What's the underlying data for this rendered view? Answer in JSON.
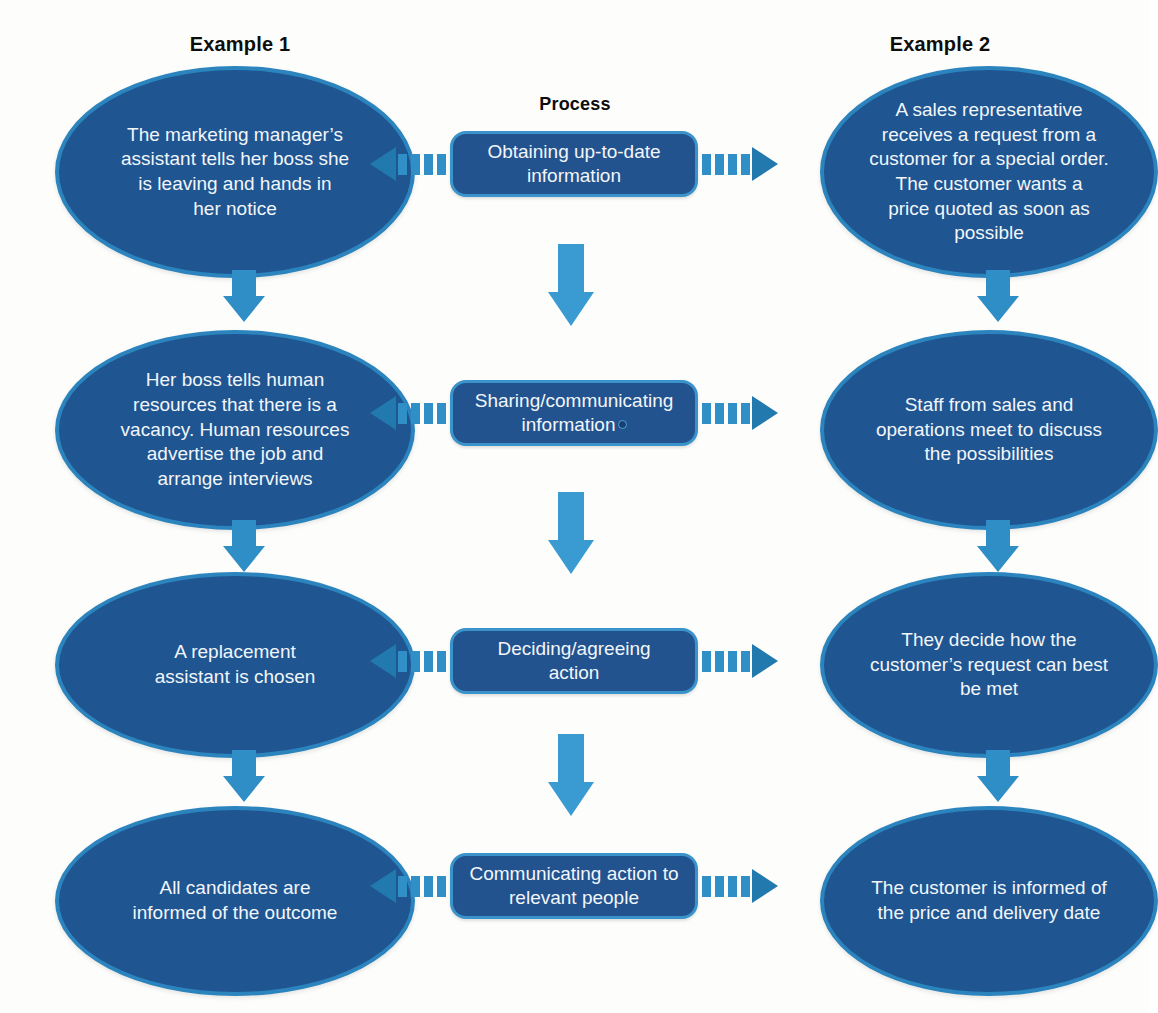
{
  "headings": {
    "left_column": "Example 1",
    "center_column": "Process",
    "right_column": "Example 2"
  },
  "colors": {
    "ellipse_fill": "#1f5591",
    "ellipse_border": "#2b84bd",
    "process_fill": "#22538e",
    "process_border": "#3a93ca",
    "arrow_light": "#3a9bd2",
    "arrow_dark": "#2279ae",
    "text": "#f2f6fa",
    "heading_text": "#0d0d0d",
    "background": "#fdfdfc"
  },
  "rows": [
    {
      "process": "Obtaining up-to-date\ninformation",
      "example1": "The marketing manager’s\nassistant tells her boss she\nis leaving and hands in\nher notice",
      "example2": "A sales representative\nreceives a request from a\ncustomer for a special order.\nThe customer wants a\nprice quoted as soon as\npossible"
    },
    {
      "process": "Sharing/communicating\ninformation",
      "example1": "Her boss tells human\nresources that there is a\nvacancy.  Human resources\nadvertise the job and\narrange interviews",
      "example2": "Staff from sales and\noperations meet to discuss\nthe possibilities"
    },
    {
      "process": "Deciding/agreeing\naction",
      "example1": "A replacement\nassistant is chosen",
      "example2": "They decide how the\ncustomer’s request can best\nbe met"
    },
    {
      "process": "Communicating action to\nrelevant people",
      "example1": "All candidates are\ninformed of the outcome",
      "example2": "The customer is informed of\nthe price and delivery date"
    }
  ],
  "icons": {
    "arrow_left": "left-dashed-arrow-icon",
    "arrow_right": "right-dashed-arrow-icon",
    "arrow_down": "down-arrow-icon"
  }
}
